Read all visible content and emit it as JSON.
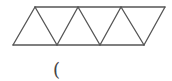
{
  "figure": {
    "stroke_color": "#555555",
    "stroke_width": 1.3,
    "top_vertices": [
      [
        35,
        7
      ],
      [
        78,
        7
      ],
      [
        121,
        7
      ],
      [
        165,
        7
      ]
    ],
    "bottom_vertices": [
      [
        13,
        45
      ],
      [
        57,
        45
      ],
      [
        100,
        45
      ],
      [
        144,
        45
      ]
    ],
    "triangle_count": 7
  },
  "answer": {
    "text": "("
  }
}
